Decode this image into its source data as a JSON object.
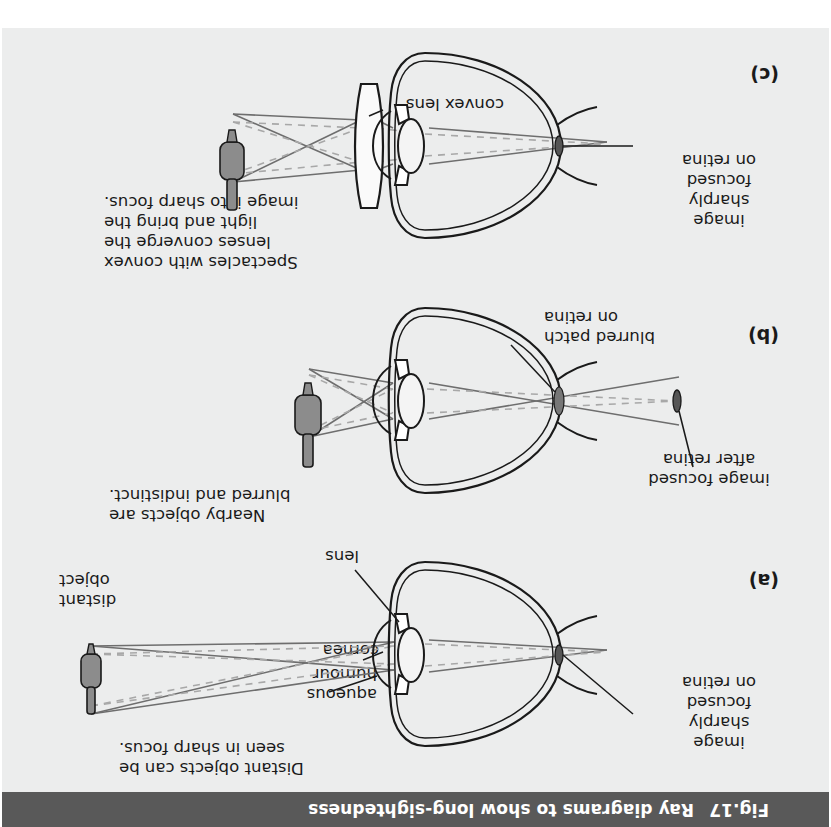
{
  "page": {
    "page_number": "88",
    "background_color": "#eceded",
    "title_bar_color": "#595959",
    "text_color": "#1a1a1a"
  },
  "figure": {
    "number": "Fig.17",
    "title": "Ray diagrams to show long-sightedness"
  },
  "panels": [
    {
      "id": "a",
      "label": "(a)",
      "caption": "Distant objects can be\nseen in sharp focus.",
      "caption_line1": "Distant objects can be",
      "caption_line2": "seen in sharp focus.",
      "object_label_line1": "distant",
      "object_label_line2": "object",
      "anatomy_labels": [
        "cornea",
        "aqueous\nhumour",
        "lens"
      ],
      "label_cornea": "cornea",
      "label_aqueous_line1": "aqueous",
      "label_aqueous_line2": "humour",
      "label_lens": "lens",
      "image_label_line1": "image",
      "image_label_line2": "sharply",
      "image_label_line3": "focused",
      "image_label_line4": "on retina"
    },
    {
      "id": "b",
      "label": "(b)",
      "caption_line1": "Nearby objects are",
      "caption_line2": "blurred and indistinct.",
      "retina_label_line1": "blurred patch",
      "retina_label_line2": "on retina",
      "image_label_line1": "image focused",
      "image_label_line2": "after retina"
    },
    {
      "id": "c",
      "label": "(c)",
      "caption_line1": "Spectacles with convex",
      "caption_line2": "lenses converge the",
      "caption_line3": "light and bring the",
      "caption_line4": "image into sharp focus.",
      "lens_label": "convex lens",
      "image_label_line1": "image",
      "image_label_line2": "sharply",
      "image_label_line3": "focused",
      "image_label_line4": "on retina"
    }
  ],
  "colors": {
    "ray_solid": "#6e6e6e",
    "ray_dashed": "#a8a8a8",
    "ink": "#1a1a1a",
    "object_fill": "#8c8c8c",
    "lens_fill": "#f4f4f4"
  }
}
